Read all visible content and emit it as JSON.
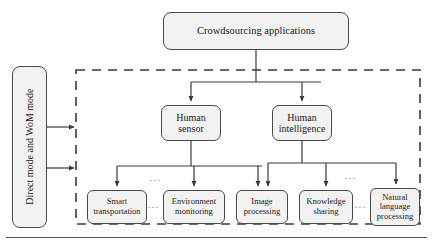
{
  "diagram": {
    "title_node": {
      "label": "Crowdsourcing applications",
      "name": "crowdsourcing-applications"
    },
    "side_node": {
      "label": "Direct mode and WoM mode",
      "name": "direct-and-wom-mode"
    },
    "mid_nodes": [
      {
        "label": "Human sensor",
        "line1": "Human",
        "line2": "sensor"
      },
      {
        "label": "Human intelligence",
        "line1": "Human",
        "line2": "intelligence"
      }
    ],
    "leaf_nodes": [
      {
        "label": "Smart transportation",
        "line1": "Smart",
        "line2": "transportation"
      },
      {
        "label": "Environment monitoring",
        "line1": "Environment",
        "line2": "monitoring"
      },
      {
        "label": "Image processing",
        "line1": "Image",
        "line2": "processing"
      },
      {
        "label": "Knowledge sharing",
        "line1": "Knowledge",
        "line2": "sharing"
      },
      {
        "label": "Natural language processing",
        "line1": "Natural",
        "line2": "language",
        "line3": "processing"
      }
    ],
    "ellipses": [
      {
        "text": "...",
        "position": "above-left-group"
      },
      {
        "text": "...",
        "position": "between-smart-and-environment"
      },
      {
        "text": "...",
        "position": "above-right-group"
      },
      {
        "text": "...",
        "position": "between-knowledge-and-natural"
      }
    ],
    "colors": {
      "node_fill": "#f2f2f2",
      "node_border": "#4a4a4a",
      "connector": "#3a3a3a",
      "dashed_border": "#3a3a3a",
      "background": "#ffffff",
      "text": "#1a1a1a"
    },
    "grouping_box": {
      "style": "dashed",
      "name": "crowdsourcing-scope-group"
    }
  }
}
